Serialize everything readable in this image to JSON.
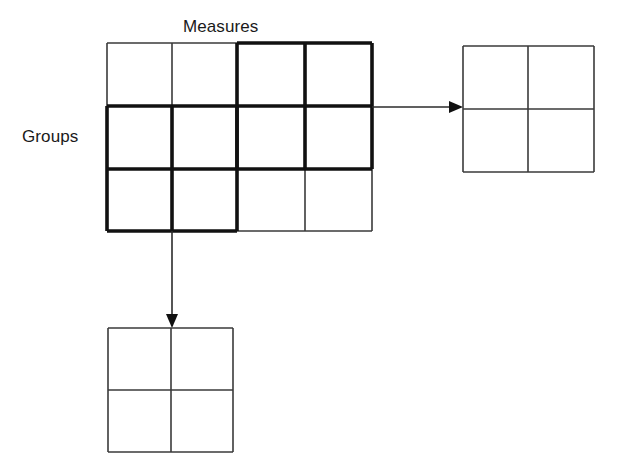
{
  "diagram": {
    "labels": {
      "measures": "Measures",
      "groups": "Groups"
    },
    "colors": {
      "thin_stroke": "#3a3a3a",
      "bold_stroke": "#111111",
      "arrow": "#2b2b2b",
      "background": "#ffffff",
      "text": "#1a1a1a"
    },
    "main_grid": {
      "name": "main-grid",
      "columns": 4,
      "rows": 3,
      "x": 107,
      "y": 43,
      "col_edges": [
        107,
        172,
        237,
        305,
        372
      ],
      "row_edges": [
        43,
        106,
        169,
        231
      ],
      "cells": [
        [
          {
            "r": 0,
            "c": 0,
            "bold": false
          },
          {
            "r": 0,
            "c": 1,
            "bold": false
          },
          {
            "r": 0,
            "c": 2,
            "bold": true
          },
          {
            "r": 0,
            "c": 3,
            "bold": true
          }
        ],
        [
          {
            "r": 1,
            "c": 0,
            "bold": true
          },
          {
            "r": 1,
            "c": 1,
            "bold": true
          },
          {
            "r": 1,
            "c": 2,
            "bold": true
          },
          {
            "r": 1,
            "c": 3,
            "bold": true
          }
        ],
        [
          {
            "r": 2,
            "c": 0,
            "bold": true
          },
          {
            "r": 2,
            "c": 1,
            "bold": true
          },
          {
            "r": 2,
            "c": 2,
            "bold": false
          },
          {
            "r": 2,
            "c": 3,
            "bold": false
          }
        ]
      ],
      "highlight_blocks": [
        {
          "name": "top-right-block",
          "cols": [
            2,
            3
          ],
          "rows": [
            0,
            1
          ]
        },
        {
          "name": "bottom-left-block",
          "cols": [
            0,
            1
          ],
          "rows": [
            1,
            2
          ]
        }
      ]
    },
    "right_grid": {
      "name": "right-grid",
      "columns": 2,
      "rows": 2,
      "x": 463,
      "y": 46,
      "col_edges": [
        463,
        528,
        594
      ],
      "row_edges": [
        46,
        109,
        172
      ]
    },
    "bottom_grid": {
      "name": "bottom-grid",
      "columns": 2,
      "rows": 2,
      "x": 108,
      "y": 328,
      "col_edges": [
        108,
        171,
        233
      ],
      "row_edges": [
        328,
        390,
        452
      ]
    },
    "arrows": [
      {
        "name": "arrow-right",
        "direction": "right",
        "from_x": 372,
        "from_y": 107,
        "to_x": 463,
        "to_y": 107
      },
      {
        "name": "arrow-down",
        "direction": "down",
        "from_x": 172,
        "from_y": 231,
        "to_x": 172,
        "to_y": 328
      }
    ]
  }
}
